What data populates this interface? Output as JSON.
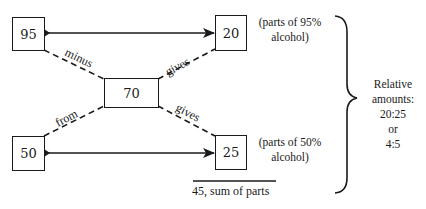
{
  "diagram": {
    "type": "alligation-mixture-diagram",
    "boxes": {
      "high_strength": "95",
      "low_strength": "50",
      "target": "70",
      "parts_high": "20",
      "parts_low": "25"
    },
    "edge_labels": {
      "minus": "minus",
      "from": "from",
      "gives_top": "gives",
      "gives_bottom": "gives"
    },
    "notes": {
      "top_line1": "(parts of 95%",
      "top_line2": "alcohol)",
      "bottom_line1": "(parts of 50%",
      "bottom_line2": "alcohol)"
    },
    "sum_label": "45, sum of parts",
    "ratio": {
      "line1": "Relative",
      "line2": "amounts:",
      "line3": "20:25",
      "line4": "or",
      "line5": "4:5"
    },
    "colors": {
      "ink": "#1a1a1a",
      "background": "#ffffff"
    }
  }
}
